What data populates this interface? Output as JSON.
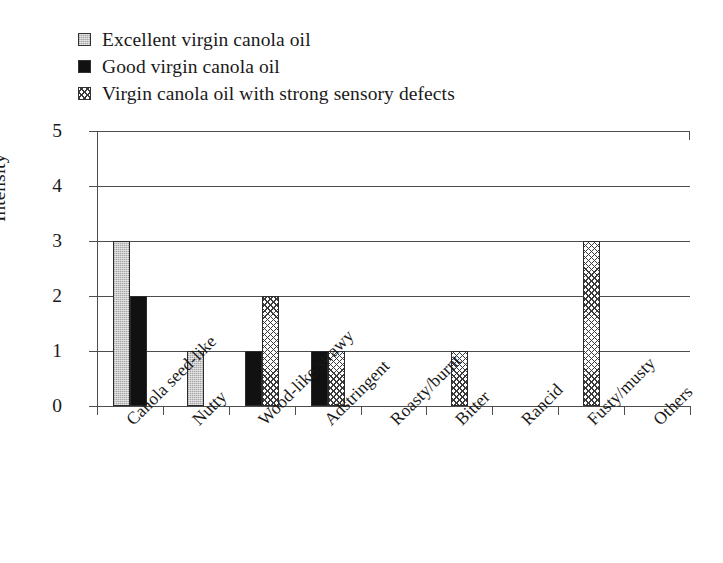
{
  "legend": {
    "items": [
      {
        "label": "Excellent virgin canola oil",
        "swatch": "excellent",
        "color": "#c9c9c9"
      },
      {
        "label": "Good virgin canola oil",
        "swatch": "good",
        "color": "#111111"
      },
      {
        "label": "Virgin canola oil with strong sensory defects",
        "swatch": "defect",
        "color": "#ffffff"
      }
    ]
  },
  "chart_data": {
    "type": "bar",
    "title": "",
    "xlabel": "",
    "ylabel": "Intensity",
    "ylim": [
      0,
      5
    ],
    "yticks": [
      0,
      1,
      2,
      3,
      4,
      5
    ],
    "grid": true,
    "legend_position": "above-plot",
    "categories": [
      "Canola seed-like",
      "Nutty",
      "Wood-like/strawy",
      "Adstringent",
      "Roasty/burnt",
      "Bitter",
      "Rancid",
      "Fusty/musty",
      "Others"
    ],
    "series": [
      {
        "name": "Excellent virgin canola oil",
        "values": [
          3,
          1,
          0,
          0,
          0,
          0,
          0,
          0,
          0
        ]
      },
      {
        "name": "Good virgin canola oil",
        "values": [
          2,
          0,
          1,
          1,
          0,
          0,
          0,
          0,
          0
        ]
      },
      {
        "name": "Virgin canola oil with strong sensory defects",
        "values": [
          0,
          0,
          2,
          1,
          0,
          1,
          0,
          3,
          0
        ]
      }
    ]
  }
}
